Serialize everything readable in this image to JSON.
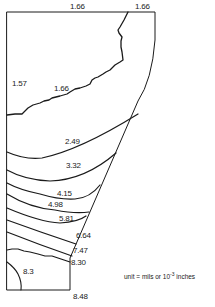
{
  "diagram": {
    "type": "contour-plot",
    "unit_note": {
      "prefix": "unit = mils or 10",
      "exponent": "-3",
      "suffix": " inches"
    },
    "contour_labels": [
      {
        "id": "top-mid",
        "text": "1.66"
      },
      {
        "id": "top-right",
        "text": "1.66"
      },
      {
        "id": "left",
        "text": "1.57"
      },
      {
        "id": "inner",
        "text": "1.66"
      },
      {
        "id": "c249",
        "text": "2.49"
      },
      {
        "id": "c332",
        "text": "3.32"
      },
      {
        "id": "c415",
        "text": "4.15"
      },
      {
        "id": "c498",
        "text": "4.98"
      },
      {
        "id": "c581",
        "text": "5.81"
      },
      {
        "id": "c664",
        "text": "6.64"
      },
      {
        "id": "c747",
        "text": "7.47"
      },
      {
        "id": "c830",
        "text": "8.30"
      },
      {
        "id": "c83",
        "text": "8.3"
      },
      {
        "id": "c848",
        "text": "8.48"
      }
    ],
    "contour_values": [
      1.57,
      1.66,
      2.49,
      3.32,
      4.15,
      4.98,
      5.81,
      6.64,
      7.47,
      8.3,
      8.48
    ],
    "colors": {
      "line": "#1a1a1a",
      "background": "#ffffff"
    }
  }
}
